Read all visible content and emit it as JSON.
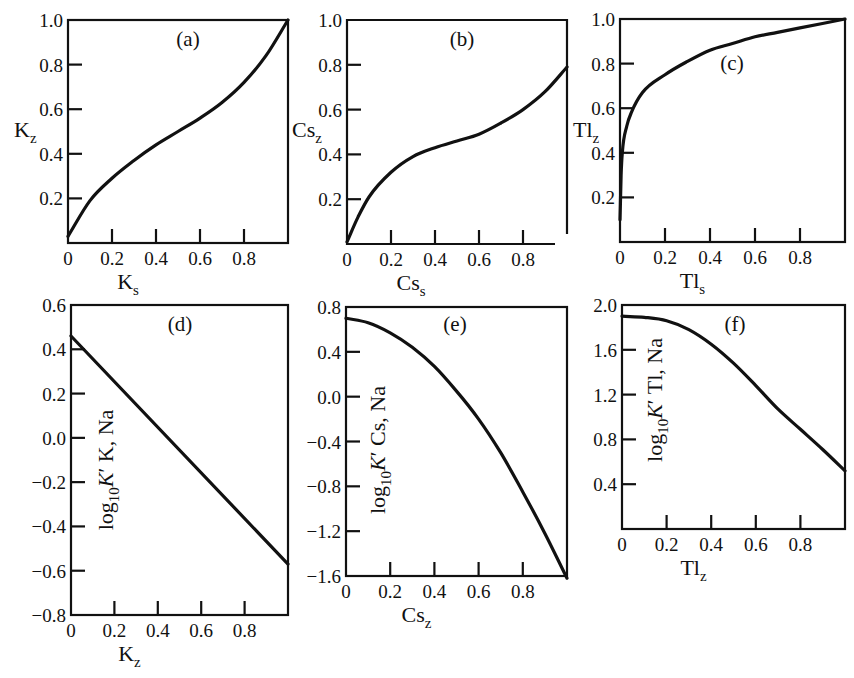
{
  "chart_data": [
    {
      "id": "a",
      "type": "line",
      "panel_label": "(a)",
      "xlabel": "K",
      "xlabel_sub": "s",
      "ylabel": "K",
      "ylabel_sub": "z",
      "xlim": [
        0,
        1
      ],
      "ylim": [
        0,
        1
      ],
      "xticks": [
        0,
        0.2,
        0.4,
        0.6,
        0.8
      ],
      "xtick_labels": [
        "0",
        "0.2",
        "0.4",
        "0.6",
        "0.8"
      ],
      "yticks": [
        0.2,
        0.4,
        0.6,
        0.8,
        1.0
      ],
      "ytick_labels": [
        "0.2",
        "0.4",
        "0.6",
        "0.8",
        "1.0"
      ],
      "x": [
        0,
        0.1,
        0.2,
        0.3,
        0.4,
        0.5,
        0.6,
        0.7,
        0.8,
        0.9,
        1.0
      ],
      "y": [
        0.03,
        0.19,
        0.29,
        0.37,
        0.44,
        0.5,
        0.56,
        0.63,
        0.72,
        0.84,
        1.0
      ],
      "grid": false
    },
    {
      "id": "b",
      "type": "line",
      "panel_label": "(b)",
      "xlabel": "Cs",
      "xlabel_sub": "s",
      "ylabel": "Cs",
      "ylabel_sub": "z",
      "xlim": [
        0,
        1
      ],
      "ylim": [
        0,
        1
      ],
      "xticks": [
        0,
        0.2,
        0.4,
        0.6,
        0.8
      ],
      "xtick_labels": [
        "0",
        "0.2",
        "0.4",
        "0.6",
        "0.8"
      ],
      "yticks": [
        0.2,
        0.4,
        0.6,
        0.8,
        1.0
      ],
      "ytick_labels": [
        "0.2",
        "0.4",
        "0.6",
        "0.8",
        "1.0"
      ],
      "x": [
        0,
        0.05,
        0.1,
        0.2,
        0.3,
        0.4,
        0.5,
        0.6,
        0.7,
        0.8,
        0.9,
        1.0
      ],
      "y": [
        0.01,
        0.12,
        0.21,
        0.32,
        0.39,
        0.43,
        0.46,
        0.49,
        0.54,
        0.6,
        0.68,
        0.79
      ],
      "grid": false
    },
    {
      "id": "c",
      "type": "line",
      "panel_label": "(c)",
      "xlabel": "Tl",
      "xlabel_sub": "s",
      "ylabel": "Tl",
      "ylabel_sub": "z",
      "xlim": [
        0,
        1
      ],
      "ylim": [
        0,
        1
      ],
      "xticks": [
        0,
        0.2,
        0.4,
        0.6,
        0.8
      ],
      "xtick_labels": [
        "0",
        "0.2",
        "0.4",
        "0.6",
        "0.8"
      ],
      "yticks": [
        0.2,
        0.4,
        0.6,
        0.8,
        1.0
      ],
      "ytick_labels": [
        "0.2",
        "0.4",
        "0.6",
        "0.8",
        "1.0"
      ],
      "x": [
        0,
        0.005,
        0.01,
        0.03,
        0.05,
        0.1,
        0.2,
        0.3,
        0.4,
        0.5,
        0.6,
        0.7,
        0.8,
        0.9,
        1.0
      ],
      "y": [
        0.1,
        0.3,
        0.4,
        0.52,
        0.58,
        0.67,
        0.75,
        0.81,
        0.86,
        0.89,
        0.92,
        0.94,
        0.96,
        0.98,
        1.0
      ],
      "grid": false
    },
    {
      "id": "d",
      "type": "line",
      "panel_label": "(d)",
      "xlabel": "K",
      "xlabel_sub": "z",
      "ylabel": "log10K' K, Na",
      "ylabel_parts": {
        "pre": "log",
        "sub": "10",
        "italic": "K",
        "post": "′ K, Na"
      },
      "xlim": [
        0,
        1
      ],
      "ylim": [
        -0.8,
        0.6
      ],
      "xticks": [
        0,
        0.2,
        0.4,
        0.6,
        0.8
      ],
      "xtick_labels": [
        "0",
        "0.2",
        "0.4",
        "0.6",
        "0.8"
      ],
      "yticks": [
        -0.8,
        -0.6,
        -0.4,
        -0.2,
        0.0,
        0.2,
        0.4,
        0.6
      ],
      "ytick_labels": [
        "−0.8",
        "−0.6",
        "−0.4",
        "−0.2",
        "0.0",
        "0.2",
        "0.4",
        "0.6"
      ],
      "x": [
        0,
        1.0
      ],
      "y": [
        0.46,
        -0.57
      ],
      "grid": false
    },
    {
      "id": "e",
      "type": "line",
      "panel_label": "(e)",
      "xlabel": "Cs",
      "xlabel_sub": "z",
      "ylabel": "log10K' Cs, Na",
      "ylabel_parts": {
        "pre": "log",
        "sub": "10",
        "italic": "K",
        "post": "′ Cs, Na"
      },
      "xlim": [
        0,
        1
      ],
      "ylim": [
        -1.6,
        0.8
      ],
      "xticks": [
        0,
        0.2,
        0.4,
        0.6,
        0.8
      ],
      "xtick_labels": [
        "0",
        "0.2",
        "0.4",
        "0.6",
        "0.8"
      ],
      "yticks": [
        -1.6,
        -1.2,
        -0.8,
        -0.4,
        0.0,
        0.4,
        0.8
      ],
      "ytick_labels": [
        "−1.6",
        "−1.2",
        "−0.8",
        "−0.4",
        "0.0",
        "0.4",
        "0.8"
      ],
      "x": [
        0,
        0.1,
        0.2,
        0.3,
        0.4,
        0.5,
        0.6,
        0.7,
        0.8,
        0.9,
        1.0
      ],
      "y": [
        0.7,
        0.66,
        0.57,
        0.44,
        0.27,
        0.05,
        -0.2,
        -0.5,
        -0.85,
        -1.22,
        -1.62
      ],
      "grid": false
    },
    {
      "id": "f",
      "type": "line",
      "panel_label": "(f)",
      "xlabel": "Tl",
      "xlabel_sub": "z",
      "ylabel": "log10K' Tl, Na",
      "ylabel_parts": {
        "pre": "log",
        "sub": "10",
        "italic": "K",
        "post": "′ Tl, Na"
      },
      "xlim": [
        0,
        1
      ],
      "ylim": [
        0.0,
        2.0
      ],
      "xticks": [
        0,
        0.2,
        0.4,
        0.6,
        0.8
      ],
      "xtick_labels": [
        "0",
        "0.2",
        "0.4",
        "0.6",
        "0.8"
      ],
      "yticks": [
        0.4,
        0.8,
        1.2,
        1.6,
        2.0
      ],
      "ytick_labels": [
        "0.4",
        "0.8",
        "1.2",
        "1.6",
        "2.0"
      ],
      "x": [
        0,
        0.1,
        0.2,
        0.3,
        0.4,
        0.5,
        0.6,
        0.7,
        0.8,
        0.9,
        1.0
      ],
      "y": [
        1.9,
        1.89,
        1.86,
        1.78,
        1.65,
        1.48,
        1.28,
        1.07,
        0.89,
        0.71,
        0.52
      ],
      "grid": false
    }
  ]
}
